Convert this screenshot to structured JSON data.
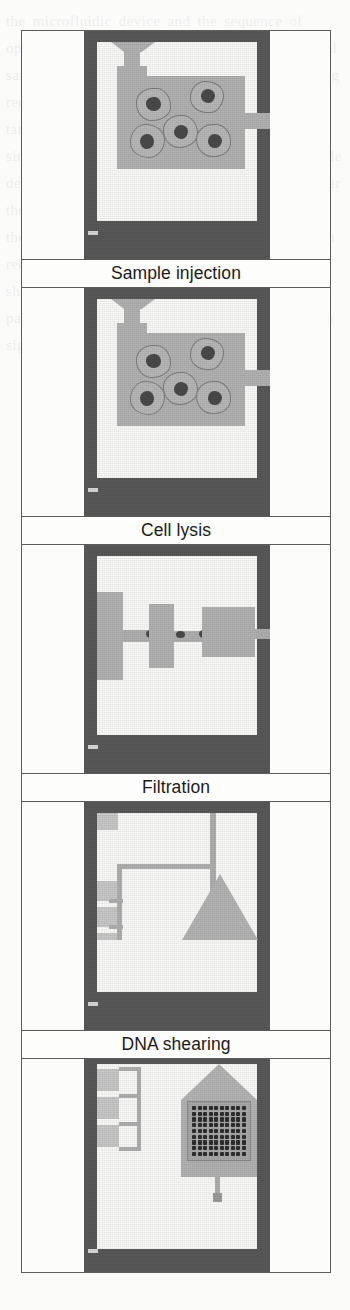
{
  "figure": {
    "name": "microfluidic-biochip-process-sequence",
    "panels": [
      {
        "id": "sample-injection",
        "caption": "Sample injection",
        "description": "Dark chip substrate with white cavity; inlet funnel at top feeds a large light-gray fluid chamber containing five cells with dark nuclei; outlet port at right.",
        "cell_count": 5,
        "has_inlet_funnel": true,
        "has_outlet_port": true
      },
      {
        "id": "cell-lysis",
        "caption": "Cell lysis",
        "description": "Same chamber as sample injection, cells still present and intact in the gray lysis fluid.",
        "cell_count": 5,
        "has_inlet_funnel": true,
        "has_outlet_port": true
      },
      {
        "id": "filtration",
        "caption": "Filtration",
        "description": "Three gray chambers connected left to right by narrow channels with dark constriction points acting as filters; outlet at right edge.",
        "chamber_count": 3,
        "constriction_count": 3
      },
      {
        "id": "dna-shearing",
        "caption": "DNA shearing",
        "description": "Routing channels from three small left-edge reservoirs join a vertical channel leading into a large triangular shearing region at lower right.",
        "reservoir_count": 3,
        "has_triangular_shear_region": true
      },
      {
        "id": "hybridization-and-detection",
        "caption": "Hybridization and detection",
        "description": "Triangular region feeds a square microarray of dark hybridization spots with a single outlet channel at the bottom; three reservoirs on the left edge.",
        "reservoir_count": 3,
        "array_columns": 10,
        "array_rows": 9,
        "has_outlet_channel": true
      }
    ]
  },
  "colors": {
    "substrate": "#595959",
    "cavity": "#fbfbf9",
    "fluid": "#b3b3b3",
    "fluid_light": "#c9c9c9",
    "fluid_dark": "#9c9c9c",
    "nucleus": "#4a4a4a",
    "spot": "#2e2e2e",
    "frame": "#5c5c5c",
    "caption_text": "#1a1a1a"
  },
  "page_bleed": {
    "text": "the microfluidic device and the sequence of operations the chip performs on a raw biological sample without any off-chip handling steps being required at all of analysis and detection of the target nucleic acid sequences integrated onto a single substrate of the sample preparation module described in the preceding section of this chapter the reagents are stored in sealed reservoirs on the chip and released by thermal actuation when required for each of the five processing stages shown schematically in the figure alongside this paragraph of text and the resulting hybridization signal is read out optically"
  }
}
